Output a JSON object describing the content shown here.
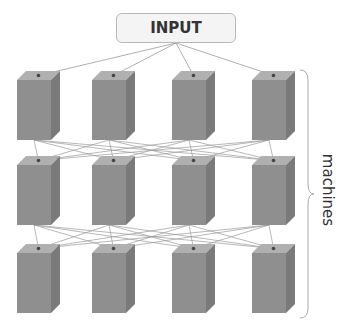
{
  "diagram": {
    "input_label": "INPUT",
    "side_label": "machines",
    "colors": {
      "box_front": "#8f8f8f",
      "box_top": "#b0b0b0",
      "box_side": "#7a7a7a",
      "edge": "#9a9a9a",
      "input_fill": "#f4f4f4",
      "input_border": "#b8b8b8"
    },
    "grid": {
      "rows": 3,
      "columns": 4,
      "column_x": [
        17,
        92,
        172,
        252
      ],
      "row_top_y": [
        80,
        165,
        253
      ],
      "box_width": 34,
      "box_height": 60,
      "depth": 9
    },
    "connections": "input fans out to every box in row 1; every box in a row connects to every box in the next row"
  }
}
